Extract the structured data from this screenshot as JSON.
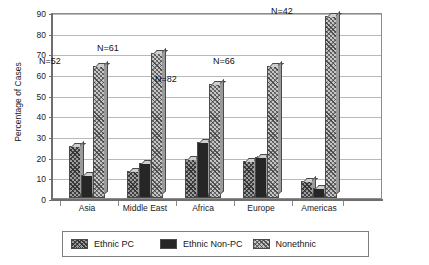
{
  "chart_data": {
    "type": "bar",
    "title": "",
    "xlabel": "",
    "ylabel": "Percentage of Cases",
    "ylim": [
      0,
      90
    ],
    "yticks": [
      0,
      10,
      20,
      30,
      40,
      50,
      60,
      70,
      80,
      90
    ],
    "grid": true,
    "legend_position": "bottom",
    "categories": [
      "Asia",
      "Middle East",
      "Africa",
      "Europe",
      "Americas"
    ],
    "annotations": [
      "N=52",
      "N=61",
      "N=82",
      "N=66",
      "N=42"
    ],
    "series": [
      {
        "name": "Ethnic PC",
        "values": [
          25,
          13,
          19,
          18,
          8
        ]
      },
      {
        "name": "Ethnic Non-PC",
        "values": [
          11,
          17,
          27,
          20,
          5
        ]
      },
      {
        "name": "Nonethnic",
        "values": [
          64,
          70,
          55,
          64,
          88
        ]
      }
    ],
    "colors": {
      "ethnic_pc": "#9d9d9d",
      "ethnic_non_pc": "#262626",
      "nonethnic": "#c6c6c6",
      "axis": "#6e6e6e",
      "grid": "#b9b9b9",
      "background": "#ffffff"
    }
  },
  "legend": {
    "items": [
      {
        "label": "Ethnic PC",
        "swatch": "hatch-dark-swatch"
      },
      {
        "label": "Ethnic Non-PC",
        "swatch": "solid-black-swatch"
      },
      {
        "label": "Nonethnic",
        "swatch": "hatch-light-swatch"
      }
    ]
  }
}
